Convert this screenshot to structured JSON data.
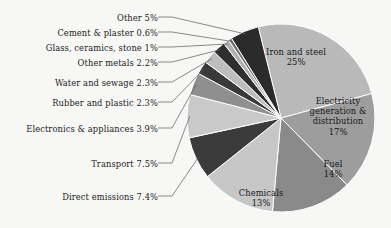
{
  "chart_data": {
    "type": "pie",
    "title": "",
    "subtitle": "",
    "xlabel": "",
    "ylabel": "",
    "legend_position": "none",
    "grid": false,
    "units": "percent",
    "total": 101.2,
    "categories": [
      "Iron and steel",
      "Electricity generation & distribution",
      "Fuel",
      "Chemicals",
      "Direct emissions",
      "Transport",
      "Electronics & appliances",
      "Rubber and plastic",
      "Water and sewage",
      "Other metals",
      "Glass, ceramics, stone",
      "Cement & plaster",
      "Other"
    ],
    "values": [
      25,
      17,
      14,
      13,
      7.4,
      7.5,
      3.9,
      2.3,
      2.3,
      2.2,
      1,
      0.6,
      5
    ],
    "slices": [
      {
        "name": "Iron and steel",
        "label": "Iron and steel",
        "value": 25,
        "value_text": "25%",
        "color": "#b9b9b9",
        "label_placement": "inside"
      },
      {
        "name": "Electricity generation & distribution",
        "label_line1": "Electricity",
        "label_line2": "generation &",
        "label_line3": "distribution",
        "value": 17,
        "value_text": "17%",
        "color": "#9d9d9d",
        "label_placement": "inside"
      },
      {
        "name": "Fuel",
        "label": "Fuel",
        "value": 14,
        "value_text": "14%",
        "color": "#8a8a8a",
        "label_placement": "inside"
      },
      {
        "name": "Chemicals",
        "label": "Chemicals",
        "value": 13,
        "value_text": "13%",
        "color": "#c6c6c6",
        "label_placement": "inside"
      },
      {
        "name": "Direct emissions",
        "label": "Direct emissions 7.4%",
        "value": 7.4,
        "color": "#3b3b3b",
        "label_placement": "outside"
      },
      {
        "name": "Transport",
        "label": "Transport 7.5%",
        "value": 7.5,
        "color": "#c9c9c9",
        "label_placement": "outside"
      },
      {
        "name": "Electronics & appliances",
        "label": "Electronics & appliances 3.9%",
        "value": 3.9,
        "color": "#8f8f8f",
        "label_placement": "outside"
      },
      {
        "name": "Rubber and plastic",
        "label": "Rubber and plastic 2.3%",
        "value": 2.3,
        "color": "#3a3a3a",
        "label_placement": "outside"
      },
      {
        "name": "Water and sewage",
        "label": "Water and sewage 2.3%",
        "value": 2.3,
        "color": "#bdbdbd",
        "label_placement": "outside"
      },
      {
        "name": "Other metals",
        "label": "Other metals 2.2%",
        "value": 2.2,
        "color": "#2f2f2f",
        "label_placement": "outside"
      },
      {
        "name": "Glass, ceramics, stone",
        "label": "Glass, ceramics, stone 1%",
        "value": 1,
        "color": "#b0b0b0",
        "label_placement": "outside"
      },
      {
        "name": "Cement & plaster",
        "label": "Cement & plaster 0.6%",
        "value": 0.6,
        "color": "#6e6e6e",
        "label_placement": "outside"
      },
      {
        "name": "Other",
        "label": "Other 5%",
        "value": 5,
        "color": "#2b2b2b",
        "label_placement": "outside"
      }
    ]
  },
  "colors": {
    "background": "#f7f7f5",
    "text": "#1c1c1c",
    "leader_line": "#5a5a5a",
    "slice_edge": "#ffffff"
  }
}
